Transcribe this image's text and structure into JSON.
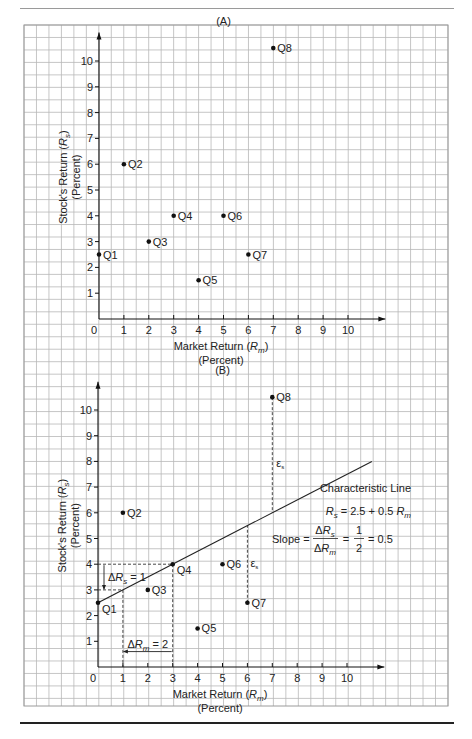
{
  "chart_data": [
    {
      "type": "scatter",
      "panel": "(A)",
      "title": "(A)",
      "xlabel": "Market Return (R_m)",
      "xlabel_units": "(Percent)",
      "ylabel": "Stock's Return (R_s)",
      "ylabel_units": "(Percent)",
      "xlim": [
        0,
        11
      ],
      "ylim": [
        0,
        11
      ],
      "x_ticks": [
        0,
        1,
        2,
        3,
        4,
        5,
        6,
        7,
        8,
        9,
        10
      ],
      "y_ticks": [
        1,
        2,
        3,
        4,
        5,
        6,
        7,
        8,
        9,
        10
      ],
      "grid": true,
      "points": [
        {
          "label": "Q1",
          "x": 0,
          "y": 2.5
        },
        {
          "label": "Q2",
          "x": 1,
          "y": 6
        },
        {
          "label": "Q3",
          "x": 2,
          "y": 3
        },
        {
          "label": "Q4",
          "x": 3,
          "y": 4
        },
        {
          "label": "Q5",
          "x": 4,
          "y": 1.5
        },
        {
          "label": "Q6",
          "x": 5,
          "y": 4
        },
        {
          "label": "Q7",
          "x": 6,
          "y": 2.5
        },
        {
          "label": "Q8",
          "x": 7,
          "y": 10.5
        }
      ]
    },
    {
      "type": "scatter",
      "panel": "(B)",
      "title": "(B)",
      "xlabel": "Market Return (R_m)",
      "xlabel_units": "(Percent)",
      "ylabel": "Stock's Return (R_s)",
      "ylabel_units": "(Percent)",
      "xlim": [
        0,
        11
      ],
      "ylim": [
        0,
        11
      ],
      "x_ticks": [
        0,
        1,
        2,
        3,
        4,
        5,
        6,
        7,
        8,
        9,
        10
      ],
      "y_ticks": [
        1,
        2,
        3,
        4,
        5,
        6,
        7,
        8,
        9,
        10
      ],
      "grid": true,
      "points": [
        {
          "label": "Q1",
          "x": 0,
          "y": 2.5
        },
        {
          "label": "Q2",
          "x": 1,
          "y": 6
        },
        {
          "label": "Q3",
          "x": 2,
          "y": 3
        },
        {
          "label": "Q4",
          "x": 3,
          "y": 4
        },
        {
          "label": "Q5",
          "x": 4,
          "y": 1.5
        },
        {
          "label": "Q6",
          "x": 5,
          "y": 4
        },
        {
          "label": "Q7",
          "x": 6,
          "y": 2.5
        },
        {
          "label": "Q8",
          "x": 7,
          "y": 10.5
        }
      ],
      "line": {
        "name": "Characteristic Line",
        "equation": "R_s = 2.5 + 0.5 R_m",
        "intercept": 2.5,
        "slope": 0.5,
        "x_range": [
          0,
          11
        ]
      },
      "annotations": {
        "line_title": "Characteristic Line",
        "equation_lhs": "R",
        "equation_lhs_sub": "s",
        "equation_rhs": " = 2.5 + 0.5 ",
        "equation_rhs_var": "R",
        "equation_rhs_sub": "m",
        "slope_label": "Slope = ",
        "slope_num": "ΔR",
        "slope_num_sub": "s",
        "slope_den": "ΔR",
        "slope_den_sub": "m",
        "slope_frac_num": "1",
        "slope_frac_den": "2",
        "slope_eq1": "=",
        "slope_eq2": "= 0.5",
        "delta_rs": "ΔR",
        "delta_rs_sub": "s",
        "delta_rs_val": " = 1",
        "delta_rm": "ΔR",
        "delta_rm_sub": "m",
        "delta_rm_val": " = 2",
        "epsilon": "ε",
        "epsilon_sub": "s"
      }
    }
  ],
  "labels": {
    "panel_a": "(A)",
    "panel_b": "(B)",
    "x_title": "Market Return (",
    "x_title_var": "R",
    "x_title_sub": "m",
    "x_title_close": ")",
    "x_units": "(Percent)",
    "y_title": "Stock's Return (",
    "y_title_var": "R",
    "y_title_sub": "s",
    "y_title_close": ")",
    "y_units": "(Percent)"
  }
}
